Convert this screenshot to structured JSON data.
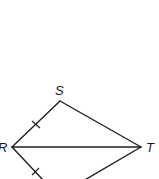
{
  "diagram": {
    "type": "geometry-figure",
    "vertices": [
      {
        "label": "S",
        "x": 60,
        "y": 101
      },
      {
        "label": "R",
        "x": 12,
        "y": 147
      },
      {
        "label": "T",
        "x": 141,
        "y": 147
      }
    ],
    "segments": [
      "RS",
      "ST",
      "RT",
      "R-bottom",
      "T-bottom"
    ],
    "congruence_marks": [
      {
        "segment": "RS",
        "ticks": 1
      },
      {
        "segment": "R-bottom",
        "ticks": 1
      }
    ],
    "colors": {
      "stroke": "#1e1e1e",
      "background": "#ffffff"
    }
  }
}
